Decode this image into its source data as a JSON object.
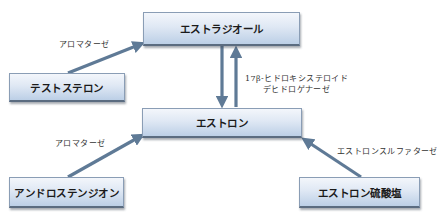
{
  "diagram": {
    "type": "metabolic-pathway",
    "nodes": {
      "estradiol": "エストラジオール",
      "testosterone": "テストステロン",
      "estrone": "エストロン",
      "androstenedione": "アンドロステンジオン",
      "estrone_sulfate": "エストロン硫酸塩"
    },
    "enzymes": {
      "aromatase_top": "アロマターゼ",
      "aromatase_bottom": "アロマターゼ",
      "hsd17b_line1": "17β-ヒドロキシステロイド",
      "hsd17b_line2": "デヒドロゲナーゼ",
      "estrone_sulfatase": "エストロンスルファターゼ"
    },
    "edges": [
      {
        "from": "testosterone",
        "to": "estradiol",
        "enzyme": "アロマターゼ"
      },
      {
        "from": "estradiol",
        "to": "estrone",
        "enzyme": "17β-ヒドロキシステロイドデヒドロゲナーゼ"
      },
      {
        "from": "estrone",
        "to": "estradiol",
        "enzyme": "17β-ヒドロキシステロイドデヒドロゲナーゼ"
      },
      {
        "from": "androstenedione",
        "to": "estrone",
        "enzyme": "アロマターゼ"
      },
      {
        "from": "estrone_sulfate",
        "to": "estrone",
        "enzyme": "エストロンスルファターゼ"
      }
    ],
    "colors": {
      "arrow": "#5f7a96",
      "box_top": "#f3f6fb",
      "box_bottom": "#bccfe6",
      "text": "#1a1a1a"
    }
  }
}
